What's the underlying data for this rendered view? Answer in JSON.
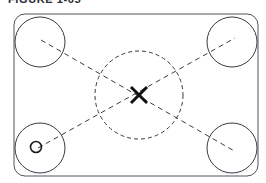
{
  "figure": {
    "caption": "FIGURE 1-65",
    "caption_visible_note": "clipped at top edge of image",
    "background_color": "#ffffff",
    "stroke_color": "#3a3a44",
    "accent_color": "#111111"
  },
  "diagram": {
    "type": "technical-layout-diagram",
    "canvas": {
      "width": 266,
      "height": 183
    },
    "outline": {
      "name": "rounded-rectangle-boundary",
      "x": 14,
      "y": 14,
      "width": 244,
      "height": 162,
      "corner_radius": 11,
      "stroke_width": 1,
      "stroke_color": "#52525c",
      "fill": "none"
    },
    "corner_circles": [
      {
        "label": "top-left-circle",
        "cx": 40,
        "cy": 42,
        "r": 25
      },
      {
        "label": "top-right-circle",
        "cx": 232,
        "cy": 42,
        "r": 25
      },
      {
        "label": "bottom-left-circle",
        "cx": 40,
        "cy": 148,
        "r": 25
      },
      {
        "label": "bottom-right-circle",
        "cx": 232,
        "cy": 148,
        "r": 25
      }
    ],
    "corner_circle_style": {
      "stroke_width": 1,
      "stroke_color": "#3a3a44",
      "fill": "none"
    },
    "center_circle": {
      "label": "center-dashed-circle",
      "cx": 139,
      "cy": 95,
      "r": 44,
      "stroke_width": 1,
      "stroke_color": "#3a3a44",
      "dash_pattern": "4 3",
      "fill": "none"
    },
    "diagonals": [
      {
        "label": "diagonal-tl-br",
        "x1": 41,
        "y1": 40,
        "x2": 236,
        "y2": 152,
        "dash_pattern": "5 4",
        "stroke_width": 1,
        "stroke_color": "#3a3a44"
      },
      {
        "label": "diagonal-bl-tr",
        "x1": 38,
        "y1": 148,
        "x2": 235,
        "y2": 38,
        "dash_pattern": "5 4",
        "stroke_width": 1,
        "stroke_color": "#3a3a44"
      }
    ],
    "center_mark": {
      "label": "center-cross-mark",
      "cx": 139,
      "cy": 95,
      "arm": 8,
      "stroke_width": 3,
      "stroke_color": "#111111"
    },
    "reference_mark": {
      "label": "reference-point-circle",
      "cx": 36,
      "cy": 147,
      "r": 5.5,
      "stroke_width": 1.6,
      "stroke_color": "#1a1a22",
      "fill": "none"
    }
  }
}
